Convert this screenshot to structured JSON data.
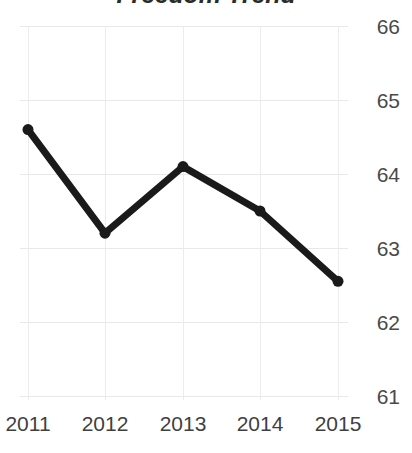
{
  "chart_data": {
    "type": "line",
    "title": "Freedom Trend",
    "xlabel": "",
    "ylabel": "",
    "categories": [
      "2011",
      "2012",
      "2013",
      "2014",
      "2015"
    ],
    "x": [
      2011,
      2012,
      2013,
      2014,
      2015
    ],
    "values": [
      64.6,
      63.2,
      64.1,
      63.5,
      62.55
    ],
    "series": [
      {
        "name": "Freedom Trend",
        "values": [
          64.6,
          63.2,
          64.1,
          63.5,
          62.55
        ]
      }
    ],
    "ylim": [
      61,
      66
    ],
    "xlim": [
      2011,
      2015
    ],
    "yticks": [
      66,
      65,
      64,
      63,
      62,
      61
    ],
    "ytick_labels": [
      "66",
      "65",
      "64",
      "63",
      "62",
      "61"
    ],
    "xticks": [
      2011,
      2012,
      2013,
      2014,
      2015
    ],
    "xtick_labels": [
      "2011",
      "2012",
      "2013",
      "2014",
      "2015"
    ],
    "grid": true,
    "grid_axes": "both",
    "legend": false,
    "legend_position": "none",
    "markers": true,
    "y_axis_side": "right",
    "colors": {
      "line": "#1a1a1a",
      "marker": "#1a1a1a",
      "grid": "#e8e8e8",
      "title_text": "#2b2b2b",
      "ytick_text": "#4a4a4a",
      "xtick_text": "#3f3f3f",
      "background": "#ffffff"
    },
    "line_width_px": 7,
    "marker_size_px": 11
  }
}
